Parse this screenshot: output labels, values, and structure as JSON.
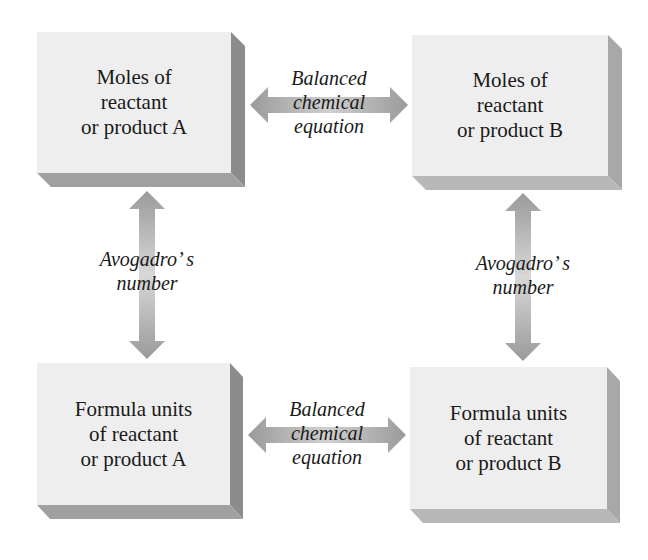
{
  "boxes": {
    "moles_a": {
      "lines": [
        "Moles of",
        "reactant",
        "or product A"
      ]
    },
    "moles_b": {
      "lines": [
        "Moles of",
        "reactant",
        "or product B"
      ]
    },
    "units_a": {
      "lines": [
        "Formula units",
        "of reactant",
        "or product A"
      ]
    },
    "units_b": {
      "lines": [
        "Formula units",
        "of reactant",
        "or product B"
      ]
    }
  },
  "connectors": {
    "top_horizontal": {
      "lines": [
        "Balanced",
        "chemical",
        "equation"
      ]
    },
    "bottom_horizontal": {
      "lines": [
        "Balanced",
        "chemical",
        "equation"
      ]
    },
    "left_vertical": {
      "lines": [
        "Avogadro’ s",
        "number"
      ]
    },
    "right_vertical": {
      "lines": [
        "Avogadro’ s",
        "number"
      ]
    }
  },
  "colors": {
    "box_face": "#eeeeee",
    "box_shadow": "#9a9a9a",
    "arrow": "#a0a0a0",
    "text": "#1a1a1a"
  }
}
